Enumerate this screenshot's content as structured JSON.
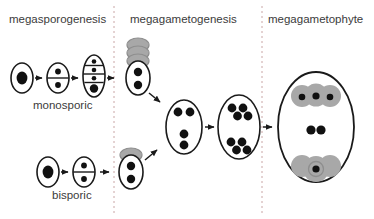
{
  "figure": {
    "background": "#ffffff",
    "width": 374,
    "height": 219,
    "outline_color": "#1a1a1a",
    "nucleus_color": "#111111",
    "degenerate_color": "#a8a8a8",
    "divider_color": "#c9a6a6",
    "text_color": "#3b3b3b"
  },
  "columns": [
    {
      "id": "megasporogenesis",
      "title": "megasporogenesis"
    },
    {
      "id": "megagametogenesis",
      "title": "megagametogenesis"
    },
    {
      "id": "megagametophyte",
      "title": "megagametophyte"
    }
  ],
  "dividers": [
    {
      "x": 114
    },
    {
      "x": 262
    }
  ],
  "pathways": [
    {
      "id": "monosporic",
      "label": "monosporic",
      "stages": [
        {
          "id": "megaspore-mother-cell",
          "compartments": 1,
          "nuclei": 1,
          "nucleus_size": "large"
        },
        {
          "id": "dyad",
          "compartments": 2,
          "nuclei": 2,
          "nucleus_size": "small"
        },
        {
          "id": "tetrad",
          "compartments": 4,
          "nuclei": 4,
          "nucleus_size": "mixed",
          "functional_megaspore": "bottom"
        },
        {
          "id": "functional-megaspore-binucleate",
          "compartments": 1,
          "nuclei": 2,
          "degenerate_cells": 3
        }
      ]
    },
    {
      "id": "bisporic",
      "label": "bisporic",
      "stages": [
        {
          "id": "megaspore-mother-cell",
          "compartments": 1,
          "nuclei": 1,
          "nucleus_size": "large"
        },
        {
          "id": "dyad",
          "compartments": 2,
          "nuclei": 2,
          "nucleus_size": "small"
        },
        {
          "id": "functional-dyad-binucleate",
          "compartments": 1,
          "nuclei": 2,
          "degenerate_cells": 1
        }
      ]
    }
  ],
  "megagametogenesis_stages": [
    {
      "id": "four-nucleate-embryo-sac",
      "nuclei": 4,
      "groups": [
        2,
        2
      ]
    },
    {
      "id": "eight-nucleate-embryo-sac",
      "nuclei": 8,
      "groups": [
        4,
        4
      ]
    }
  ],
  "megagametophyte": {
    "id": "mature-embryo-sac",
    "antipodals": 3,
    "polar_nuclei": 2,
    "synergids": 2,
    "egg_cells": 1
  }
}
